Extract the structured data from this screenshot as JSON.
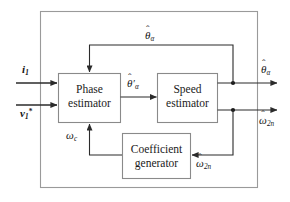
{
  "diagram": {
    "colors": {
      "line": "#2b2b2b",
      "outer_border": "#9a9a9a",
      "block_border": "#8a8a8a",
      "text": "#1a1a1a",
      "background": "#ffffff"
    },
    "blocks": [
      {
        "id": "phase-estimator",
        "line1": "Phase",
        "line2": "estimator"
      },
      {
        "id": "speed-estimator",
        "line1": "Speed",
        "line2": "estimator"
      },
      {
        "id": "coefficient-generator",
        "line1": "Coefficient",
        "line2": "generator"
      }
    ],
    "signals": {
      "input_current": {
        "base": "i",
        "sub": "1",
        "sup": "",
        "hat": false
      },
      "input_voltage": {
        "base": "v",
        "sub": "1",
        "sup": "*",
        "hat": false
      },
      "theta_prime": {
        "base": "θ",
        "sub": "α",
        "prime": "′",
        "hat": true
      },
      "theta_feedback": {
        "base": "θ",
        "sub": "α",
        "hat": true
      },
      "theta_output": {
        "base": "θ",
        "sub": "α",
        "hat": true
      },
      "omega_output": {
        "base": "ω",
        "sub": "2n",
        "hat": true
      },
      "omega_c": {
        "base": "ω",
        "sub": "c",
        "hat": false
      },
      "omega_feedback": {
        "base": "ω",
        "sub": "2n",
        "hat": true
      }
    },
    "labels": {
      "input_current_text": "i₁",
      "input_voltage_text": "v₁*",
      "theta_prime_text": "θ̂′ₐ",
      "theta_feedback_text": "θ̂ₐ",
      "theta_output_text": "θ̂ₐ",
      "omega_output_text": "ω̂₂ₙ",
      "omega_c_text": "ω_c",
      "omega_feedback_text": "ω̂₂ₙ"
    }
  }
}
